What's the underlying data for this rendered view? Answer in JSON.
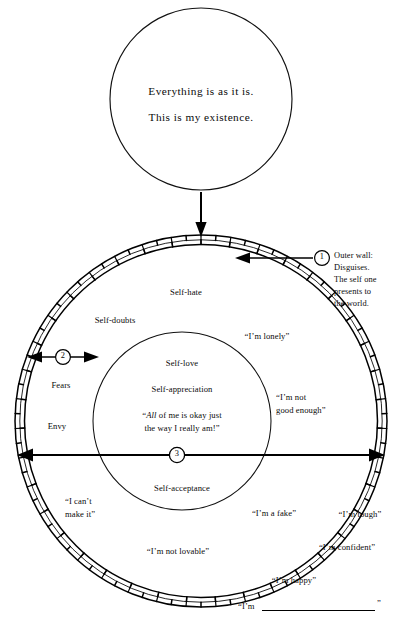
{
  "diagram": {
    "top_circle": {
      "line1": "Everything is as it is.",
      "line2": "This is my existence."
    },
    "callouts": [
      {
        "marker": "1",
        "text": "Outer wall:\nDisguises.\nThe self one\npresents to\nthe world."
      },
      {
        "marker": "2",
        "text": ""
      },
      {
        "marker": "3",
        "text": ""
      }
    ],
    "inner_circle": {
      "label_top": "Self-love",
      "label_mid": "Self-appreciation",
      "quote_italic": "All",
      "quote_rest_line1": " of me is okay just",
      "quote_line2": "the way I really am!”",
      "quote_open": "“",
      "label_bottom": "Self-acceptance"
    },
    "inside_wall_labels": [
      {
        "name": "self-hate",
        "text": "Self-hate"
      },
      {
        "name": "self-doubts",
        "text": "Self-doubts"
      },
      {
        "name": "im-lonely",
        "text": "“I’m lonely”"
      },
      {
        "name": "fears",
        "text": "Fears"
      },
      {
        "name": "envy",
        "text": "Envy"
      },
      {
        "name": "im-not-good-enough-1",
        "text": "“I’m not"
      },
      {
        "name": "im-not-good-enough-2",
        "text": "good enough”"
      },
      {
        "name": "i-cant-make-it-1",
        "text": "“I can’t"
      },
      {
        "name": "i-cant-make-it-2",
        "text": "make it”"
      },
      {
        "name": "im-a-fake",
        "text": "“I’m a fake”"
      },
      {
        "name": "im-not-lovable",
        "text": "“I’m not lovable”"
      }
    ],
    "outside_wall_labels": [
      {
        "name": "im-tough",
        "text": "“I’m tough”"
      },
      {
        "name": "im-confident",
        "text": "“I’m confident”"
      },
      {
        "name": "im-happy",
        "text": "“I’m happy”"
      }
    ],
    "blank_prompt": {
      "prefix": "“I’m",
      "suffix": "”"
    },
    "colors": {
      "ink": "#000000",
      "background": "#ffffff"
    }
  }
}
